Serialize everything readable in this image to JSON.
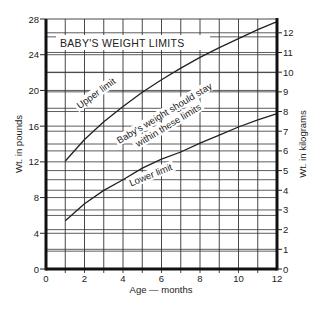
{
  "chart_data": {
    "type": "line",
    "title": "BABY'S WEIGHT LIMITS",
    "xlabel": "Age — months",
    "ylabel": "Wt. in pounds",
    "ylabel_right": "Wt. in kilograms",
    "xlim": [
      0,
      12
    ],
    "ylim": [
      0,
      28
    ],
    "ylim_right": [
      0,
      12.7
    ],
    "x_ticks": [
      0,
      2,
      4,
      6,
      8,
      10,
      12
    ],
    "y_ticks": [
      0,
      4,
      8,
      12,
      16,
      20,
      24,
      28
    ],
    "y_ticks_right": [
      0,
      1,
      2,
      3,
      4,
      5,
      6,
      7,
      8,
      9,
      10,
      11,
      12
    ],
    "grid": true,
    "x": [
      1,
      2,
      3,
      4,
      5,
      6,
      7,
      8,
      9,
      10,
      11,
      12
    ],
    "series": [
      {
        "name": "Upper limit",
        "values": [
          12.1,
          14.5,
          16.5,
          18.2,
          19.8,
          21.2,
          22.5,
          23.7,
          24.8,
          25.8,
          26.8,
          27.7
        ]
      },
      {
        "name": "Lower limit",
        "values": [
          5.4,
          7.3,
          8.8,
          10.0,
          11.3,
          12.3,
          13.1,
          14.1,
          15.0,
          15.9,
          16.7,
          17.4
        ]
      }
    ],
    "annotations": [
      "Upper limit",
      "Baby's weight should stay",
      "within these limits",
      "Lower limit"
    ]
  }
}
